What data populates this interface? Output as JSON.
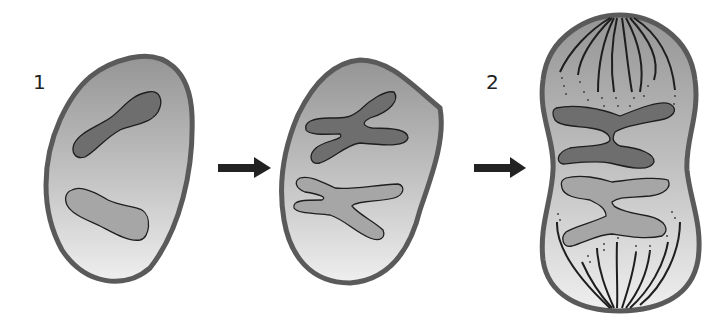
{
  "diagram": {
    "labels": {
      "stage1": "1",
      "stage2": "2"
    },
    "stages": [
      {
        "id": "cell-1",
        "description": "Cell with two unreplicated chromosomes"
      },
      {
        "id": "cell-middle",
        "description": "Cell with two replicated X-shaped chromosomes"
      },
      {
        "id": "cell-2",
        "description": "Elongated cell with aligned chromosomes and spindle fibers"
      }
    ],
    "arrows": [
      {
        "from": "cell-1",
        "to": "cell-middle"
      },
      {
        "from": "cell-middle",
        "to": "cell-2"
      }
    ],
    "colors": {
      "membrane": "#5a5a5a",
      "cytoplasm_top": "#9a9a9a",
      "cytoplasm_bottom": "#ececec",
      "chromosome_dark": "#6e6e6e",
      "chromosome_light": "#a6a6a6",
      "outline": "#1e1e1e",
      "arrow": "#222222"
    }
  }
}
